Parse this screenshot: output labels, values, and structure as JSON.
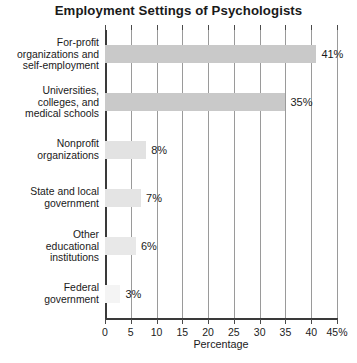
{
  "chart_data": {
    "type": "bar",
    "orientation": "horizontal",
    "title": "Employment Settings of Psychologists",
    "xlabel": "Percentage",
    "ylabel": "",
    "xlim": [
      0,
      45
    ],
    "xticks": [
      0,
      5,
      10,
      15,
      20,
      25,
      30,
      35,
      40,
      45
    ],
    "xtick_labels": [
      "0",
      "5",
      "10",
      "15",
      "20",
      "25",
      "30",
      "35",
      "40",
      "45%"
    ],
    "grid": true,
    "grid_axis": "x",
    "legend": null,
    "categories": [
      "For-profit organizations and self-employment",
      "Universities, colleges, and medical schools",
      "Nonprofit organizations",
      "State and local government",
      "Other educational institutions",
      "Federal government"
    ],
    "category_lines": [
      [
        "For-profit",
        "organizations and",
        "self-employment"
      ],
      [
        "Universities,",
        "colleges, and",
        "medical schools"
      ],
      [
        "Nonprofit",
        "organizations"
      ],
      [
        "State and local",
        "government"
      ],
      [
        "Other",
        "educational",
        "institutions"
      ],
      [
        "Federal",
        "government"
      ]
    ],
    "values": [
      41,
      35,
      8,
      7,
      6,
      3
    ],
    "data_labels": [
      "41%",
      "35%",
      "8%",
      "7%",
      "6%",
      "3%"
    ],
    "bar_colors": [
      "#c9c9c9",
      "#c9c9c9",
      "#e2e2e2",
      "#e4e4e4",
      "#e8e8e8",
      "#f4f4f4"
    ]
  },
  "colors": {
    "background": "#ffffff",
    "axis": "#3a3a3a",
    "gridline": "#9a9a9a",
    "text": "#1a1a1a"
  }
}
